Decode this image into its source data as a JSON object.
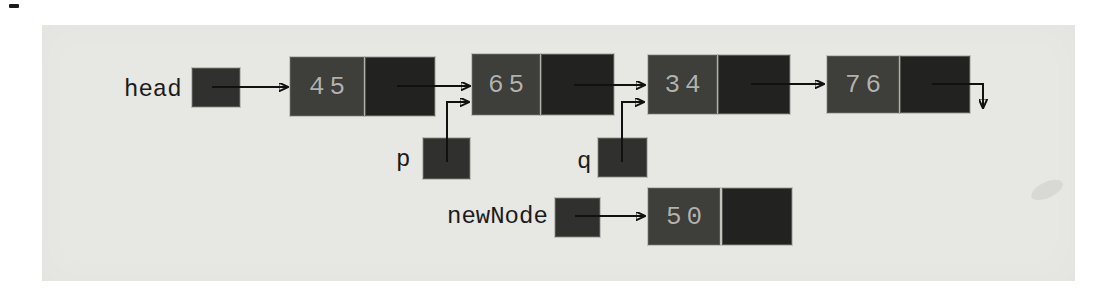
{
  "figure": {
    "kind": "singly-linked-list-diagram",
    "colors": {
      "panel_background": "#e7e7e3",
      "data_cell": "#3e3e3b",
      "next_cell": "#222220",
      "pointer_box": "#30302e",
      "value_text": "#b3b1ac",
      "label_text": "#1b1b1b",
      "arrow": "#111111"
    }
  },
  "pointers": {
    "head": {
      "label": "head"
    },
    "p": {
      "label": "p"
    },
    "q": {
      "label": "q"
    },
    "newNode": {
      "label": "newNode"
    }
  },
  "nodes": [
    {
      "id": "node-45",
      "value": "45"
    },
    {
      "id": "node-65",
      "value": "65"
    },
    {
      "id": "node-34",
      "value": "34"
    },
    {
      "id": "node-76",
      "value": "76"
    },
    {
      "id": "node-50",
      "value": "50"
    }
  ],
  "links": {
    "head_points_to": "45",
    "chain": [
      "45",
      "65",
      "34",
      "76"
    ],
    "tail_next": "null (downward arrow)",
    "p_points_to": "65",
    "q_points_to": "34",
    "newNode_points_to": "50"
  }
}
